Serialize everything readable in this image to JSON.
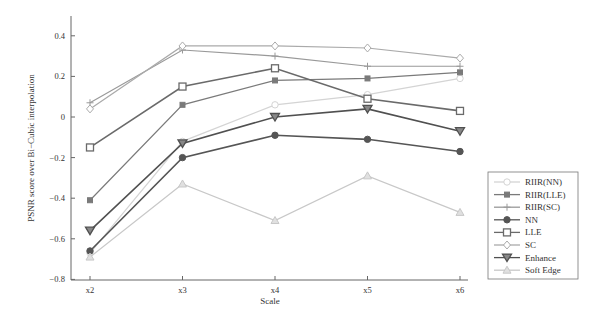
{
  "chart_data": {
    "type": "line",
    "title": "",
    "xlabel": "Scale",
    "ylabel": "PSNR score over Bi−Cubic interpolation",
    "categories": [
      "x2",
      "x3",
      "x4",
      "x5",
      "x6"
    ],
    "ylim": [
      -0.8,
      0.5
    ],
    "yticks": [
      "0.4",
      "0.2",
      "0",
      "−0.2",
      "−0.4",
      "−0.6",
      "−0.8"
    ],
    "ytick_values": [
      0.4,
      0.2,
      0,
      -0.2,
      -0.4,
      -0.6,
      -0.8
    ],
    "grid": false,
    "legend_position": "lower right, outside",
    "series": [
      {
        "name": "RIIR(NN)",
        "marker": "circle-open",
        "color": "#d4d4d4",
        "values": [
          -0.67,
          -0.12,
          0.06,
          0.11,
          0.19
        ]
      },
      {
        "name": "RIIR(LLE)",
        "marker": "square-filled",
        "color": "#7a7a7a",
        "values": [
          -0.41,
          0.06,
          0.18,
          0.19,
          0.22
        ]
      },
      {
        "name": "RIIR(SC)",
        "marker": "plus",
        "color": "#999999",
        "values": [
          0.07,
          0.33,
          0.3,
          0.25,
          0.25
        ]
      },
      {
        "name": "NN",
        "marker": "circle-filled",
        "color": "#555555",
        "values": [
          -0.66,
          -0.2,
          -0.09,
          -0.11,
          -0.17
        ]
      },
      {
        "name": "LLE",
        "marker": "square-open",
        "color": "#6a6a6a",
        "values": [
          -0.15,
          0.15,
          0.24,
          0.09,
          0.03
        ]
      },
      {
        "name": "SC",
        "marker": "diamond-open",
        "color": "#aaaaaa",
        "values": [
          0.04,
          0.35,
          0.35,
          0.34,
          0.29
        ]
      },
      {
        "name": "Enhance",
        "marker": "triangle-down",
        "color": "#505050",
        "values": [
          -0.56,
          -0.13,
          0.0,
          0.04,
          -0.07
        ]
      },
      {
        "name": "Soft Edge",
        "marker": "triangle-up",
        "color": "#c8c8c8",
        "values": [
          -0.69,
          -0.33,
          -0.51,
          -0.29,
          -0.47
        ]
      }
    ]
  }
}
